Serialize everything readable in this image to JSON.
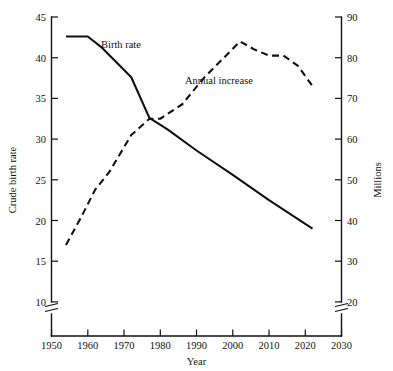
{
  "chart_data": {
    "type": "line",
    "title": "",
    "xlabel": "Year",
    "ylabel": "Crude birth rate",
    "y2label": "Millions",
    "xlim": [
      1950,
      2030
    ],
    "ylim": [
      10,
      45
    ],
    "y2lim": [
      20,
      90
    ],
    "grid": false,
    "legend_position": "inline-annotations",
    "xticks": [
      1950,
      1960,
      1970,
      1980,
      1990,
      2000,
      2010,
      2020,
      2030
    ],
    "xtick_labels": [
      "1950",
      "1960",
      "1970",
      "1980",
      "1990",
      "2000",
      "2010",
      "2020",
      "2030"
    ],
    "yticks": [
      10,
      15,
      20,
      25,
      30,
      35,
      40,
      45
    ],
    "ytick_labels": [
      "10",
      "15",
      "20",
      "25",
      "30",
      "35",
      "40",
      "45"
    ],
    "y2ticks": [
      20,
      30,
      40,
      50,
      60,
      70,
      80,
      90
    ],
    "y2tick_labels": [
      "20",
      "30",
      "40",
      "50",
      "60",
      "70",
      "80",
      "90"
    ],
    "axis_breaks": {
      "left_axis_break": true,
      "right_axis_break": true,
      "note": "both vertical axes broken below lowest tick"
    },
    "series": [
      {
        "name": "Birth rate",
        "label": "Birth rate",
        "axis": "left",
        "style": "solid",
        "units": "births per 1000 population",
        "x": [
          1954,
          1960,
          1964,
          1972,
          1977,
          1982,
          1990,
          2000,
          2010,
          2022
        ],
        "values": [
          42.6,
          42.6,
          41.2,
          37.6,
          32.6,
          31.2,
          28.6,
          25.6,
          22.5,
          19.0
        ]
      },
      {
        "name": "Annual increase",
        "label": "Annual increase",
        "axis": "right",
        "style": "dashed",
        "units": "millions per year",
        "x": [
          1954,
          1958,
          1962,
          1966,
          1972,
          1977,
          1980,
          1986,
          1992,
          1997,
          2002,
          2006,
          2010,
          2014,
          2018,
          2022
        ],
        "values": [
          34.0,
          40.5,
          47.5,
          52.0,
          61.0,
          65.0,
          65.0,
          68.5,
          75.0,
          79.5,
          84.0,
          82.0,
          80.5,
          80.5,
          78.0,
          73.0
        ]
      }
    ],
    "annotations": [
      {
        "text": "Birth rate",
        "x": 1972,
        "y": 40.6,
        "series": "Birth rate"
      },
      {
        "text": "Annual increase",
        "x": 1993,
        "y": 37.8,
        "series": "Annual increase"
      }
    ]
  },
  "colors": {
    "foreground": "#111111",
    "background": "#ffffff"
  }
}
